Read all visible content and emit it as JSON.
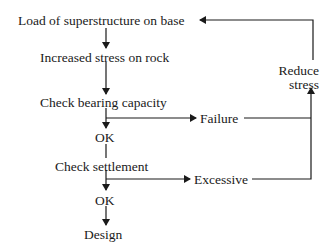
{
  "diagram": {
    "type": "flowchart",
    "nodes": {
      "load": "Load of superstructure on base",
      "stress": "Increased stress on rock",
      "bearing": "Check bearing capacity",
      "ok1": "OK",
      "settlement": "Check settlement",
      "ok2": "OK",
      "design": "Design",
      "failure": "Failure",
      "excessive": "Excessive",
      "reduce_line1": "Reduce",
      "reduce_line2": "stress"
    },
    "edges": [
      {
        "from": "Load of superstructure on base",
        "to": "Increased stress on rock"
      },
      {
        "from": "Increased stress on rock",
        "to": "Check bearing capacity"
      },
      {
        "from": "Check bearing capacity",
        "to": "OK"
      },
      {
        "from": "Check bearing capacity",
        "to": "Failure"
      },
      {
        "from": "OK",
        "to": "Check settlement"
      },
      {
        "from": "Check settlement",
        "to": "OK"
      },
      {
        "from": "Check settlement",
        "to": "Excessive"
      },
      {
        "from": "OK",
        "to": "Design"
      },
      {
        "from": "Failure",
        "to": "Reduce stress"
      },
      {
        "from": "Excessive",
        "to": "Reduce stress"
      },
      {
        "from": "Reduce stress",
        "to": "Load of superstructure on base"
      }
    ],
    "colors": {
      "line": "#1a1a1a",
      "text": "#1a1a1a",
      "background": "#ffffff"
    }
  }
}
